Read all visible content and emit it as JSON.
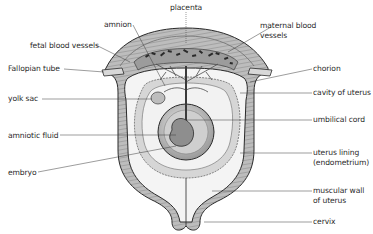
{
  "diagram": {
    "labels": {
      "placenta": "placenta",
      "amnion": "amnion",
      "maternal_blood_vessels_1": "maternal blood",
      "maternal_blood_vessels_2": "vessels",
      "fetal_blood_vessels": "fetal blood vessels",
      "fallopian_tube": "Fallopian tube",
      "chorion": "chorion",
      "cavity_of_uterus": "cavity of uterus",
      "yolk_sac": "yolk sac",
      "umbilical_cord": "umbilical cord",
      "amniotic_fluid": "amniotic fluid",
      "uterus_lining_1": "uterus lining",
      "uterus_lining_2": "(endometrium)",
      "embryo": "embryo",
      "muscular_wall_1": "muscular wall",
      "muscular_wall_2": "of uterus",
      "cervix": "cervix"
    },
    "colors": {
      "muscle": "#b8b8b8",
      "lining": "#e6e6e6",
      "chorion": "#d0d0d0",
      "amnion_sac": "#c4c4c4",
      "embryo": "#8e8e8e",
      "line": "#3a3a3a"
    }
  }
}
